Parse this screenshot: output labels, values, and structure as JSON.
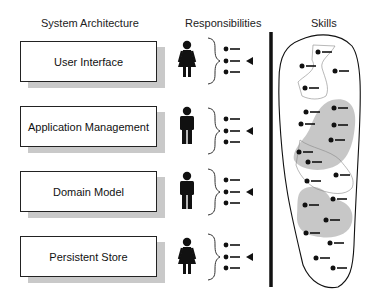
{
  "headers": {
    "architecture": "System Architecture",
    "responsibilities": "Responsibilities",
    "skills": "Skills"
  },
  "layers": [
    {
      "label": "User Interface",
      "person": "female",
      "bullets": 3,
      "pointer_index": 1
    },
    {
      "label": "Application Management",
      "person": "male",
      "bullets": 3,
      "pointer_index": 1
    },
    {
      "label": "Domain Model",
      "person": "male",
      "bullets": 3,
      "pointer_index": 1
    },
    {
      "label": "Persistent Store",
      "person": "female",
      "bullets": 3,
      "pointer_index": 1
    }
  ],
  "colors": {
    "ink": "#111111",
    "shadow": "#c9c9c9",
    "skill_cluster": "#bdbdbd"
  }
}
